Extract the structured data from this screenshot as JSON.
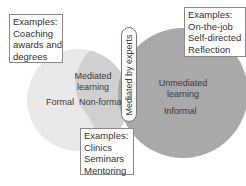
{
  "colors": {
    "mediated_circle": "#e9e9e9",
    "nonformal_region": "#d0d0d0",
    "unmediated_circle": "#a9a9a9",
    "box_border": "#8a8a8a"
  },
  "mediated": {
    "title_line1": "Mediated",
    "title_line2": "learning",
    "formal": "Formal",
    "nonformal": "Non-formal"
  },
  "unmediated": {
    "title_line1": "Unmediated",
    "title_line2": "learning",
    "informal": "Informal"
  },
  "divider_label": "Mediated by experts",
  "examples": {
    "formal": [
      "Examples:",
      "Coaching",
      "awards and",
      "degrees"
    ],
    "informal": [
      "Examples:",
      "On-the-job",
      "Self-directed",
      "Reflection"
    ],
    "nonformal": [
      "Examples:",
      "Clinics",
      "Seminars",
      "Mentoring"
    ]
  }
}
